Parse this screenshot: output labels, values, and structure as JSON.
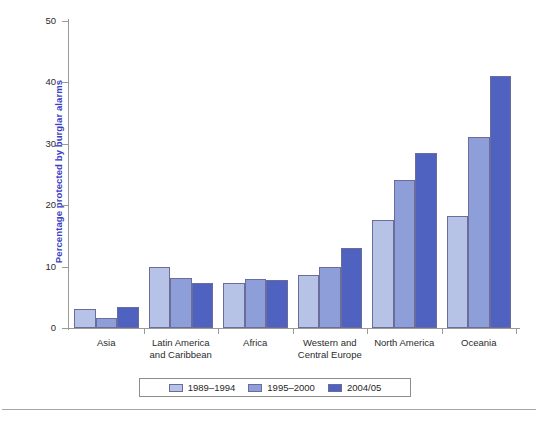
{
  "chart_data": {
    "type": "bar",
    "title": "",
    "xlabel": "",
    "ylabel": "Percentage protected by burglar alarms",
    "ylim": [
      0,
      50
    ],
    "yticks": [
      0,
      10,
      20,
      30,
      40,
      50
    ],
    "ytick_labels": [
      "0",
      "10",
      "20",
      "30",
      "40",
      "50"
    ],
    "grid": false,
    "legend_position": "bottom",
    "categories": [
      "Asia",
      "Latin America\nand Caribbean",
      "Africa",
      "Western and\nCentral Europe",
      "North America",
      "Oceania"
    ],
    "series": [
      {
        "name": "1989–1994",
        "color": "#b6c2e6",
        "values": [
          3.1,
          10.0,
          7.4,
          8.7,
          17.6,
          18.3
        ]
      },
      {
        "name": "1995–2000",
        "color": "#8e9ed9",
        "values": [
          1.6,
          8.1,
          8.0,
          10.0,
          24.1,
          31.1
        ]
      },
      {
        "name": "2004/05",
        "color": "#4f62c0",
        "values": [
          3.4,
          7.3,
          7.8,
          13.1,
          28.5,
          41.0
        ]
      }
    ]
  },
  "axis": {
    "label_color": "#3b41c4",
    "line_color": "#9a9a9a"
  },
  "legend": {
    "entries": [
      "1989–1994",
      "1995–2000",
      "2004/05"
    ]
  }
}
